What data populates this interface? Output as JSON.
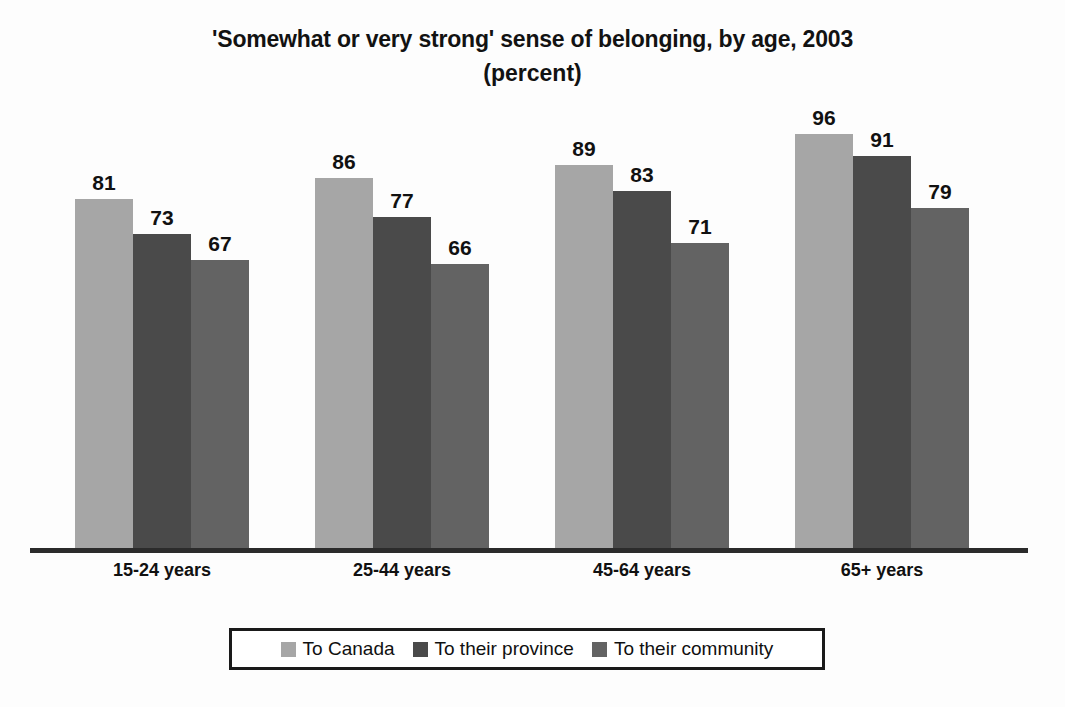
{
  "chart_data": {
    "type": "bar",
    "title": "'Somewhat or very strong' sense of belonging, by age, 2003",
    "subtitle": "(percent)",
    "xlabel": "",
    "ylabel": "",
    "ylim": [
      0,
      100
    ],
    "grid": false,
    "legend_position": "bottom",
    "categories": [
      "15-24 years",
      "25-44 years",
      "45-64 years",
      "65+ years"
    ],
    "series": [
      {
        "name": "To Canada",
        "color": "#a6a6a6",
        "values": [
          81,
          86,
          89,
          96
        ]
      },
      {
        "name": "To their province",
        "color": "#4a4a4a",
        "values": [
          73,
          77,
          83,
          91
        ]
      },
      {
        "name": "To their community",
        "color": "#636363",
        "values": [
          67,
          66,
          71,
          79
        ]
      }
    ]
  },
  "legend": {
    "items": [
      {
        "label": "To Canada",
        "color": "#a6a6a6"
      },
      {
        "label": "To their province",
        "color": "#4a4a4a"
      },
      {
        "label": "To their community",
        "color": "#636363"
      }
    ]
  },
  "colors": {
    "background": "#fdfdfd",
    "axis": "#2b2b2b",
    "text": "#111111",
    "legend_border": "#1a1a1a"
  }
}
